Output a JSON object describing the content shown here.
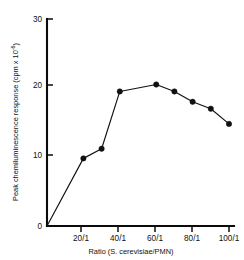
{
  "chart_data": {
    "type": "line",
    "title": "",
    "xlabel": "Ratio (S. cerevisiae/PMN)",
    "ylabel": "Peak chemiluminescence response",
    "ylabel_units": "(cpm x 10",
    "ylabel_exponent": "-6",
    "ylabel_units_close": ")",
    "xlim": [
      0,
      110
    ],
    "ylim": [
      0,
      30
    ],
    "grid": false,
    "legend": "none",
    "marker": "filled-circle",
    "x_tick_values": [
      20,
      40,
      60,
      80,
      100
    ],
    "x_tick_labels": [
      "20/1",
      "40/1",
      "60/1",
      "80/1",
      "100/1"
    ],
    "y_tick_values": [
      0,
      10,
      20,
      30
    ],
    "y_tick_labels": [
      "0",
      "10",
      "20",
      "30"
    ],
    "x": [
      0,
      20,
      30,
      40,
      60,
      70,
      80,
      90,
      100
    ],
    "values": [
      0,
      9.8,
      11.2,
      19.5,
      20.5,
      19.5,
      18.0,
      17.0,
      14.8
    ],
    "origin_point_has_marker": false,
    "points": [
      {
        "x": 0,
        "y": 0.0,
        "marker": false
      },
      {
        "x": 20,
        "y": 9.8,
        "marker": true
      },
      {
        "x": 30,
        "y": 11.2,
        "marker": true
      },
      {
        "x": 40,
        "y": 19.5,
        "marker": true
      },
      {
        "x": 60,
        "y": 20.5,
        "marker": true
      },
      {
        "x": 70,
        "y": 19.5,
        "marker": true
      },
      {
        "x": 80,
        "y": 18.0,
        "marker": true
      },
      {
        "x": 90,
        "y": 17.0,
        "marker": true
      },
      {
        "x": 100,
        "y": 14.8,
        "marker": true
      }
    ],
    "colors": {
      "line": "#111111",
      "marker": "#111111",
      "axis": "#0b0b0b",
      "background": "#ffffff"
    }
  }
}
